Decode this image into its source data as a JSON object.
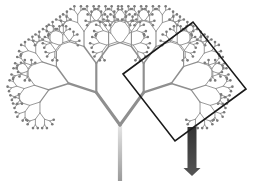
{
  "figure": {
    "width": 263,
    "height": 191,
    "background": "#ffffff"
  },
  "tree": {
    "root": [
      120,
      181
    ],
    "trunk_length": 56,
    "initial_angle_deg": -90,
    "branch_angle_deg": 36,
    "length_ratio": 0.72,
    "depth": 8,
    "trunk_width": 4.2,
    "width_ratio": 0.72,
    "trunk_color_bottom": "#9a9a9a",
    "trunk_color_top": "#e6e6e6",
    "branch_color": "#8f8f8f",
    "leaf_dot_color": "#7a7a7a",
    "leaf_dot_radius": 1.3
  },
  "highlight_square": {
    "points": [
      [
        123,
        74
      ],
      [
        193,
        22
      ],
      [
        246,
        89
      ],
      [
        175,
        141
      ]
    ],
    "stroke": "#1a1a1a",
    "stroke_width": 1.6
  },
  "arrow": {
    "x": 192,
    "y_start": 127,
    "y_end": 176,
    "shaft_width": 9,
    "head_width": 17,
    "head_height": 8,
    "color_top": "#333333",
    "color_bottom": "#555555"
  }
}
